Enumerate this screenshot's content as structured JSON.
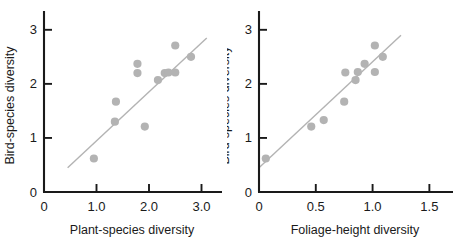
{
  "figure": {
    "background": "#ffffff",
    "point_color": "#b3b3b3",
    "line_color": "#b3b3b3",
    "axis_color": "#1a1a1a"
  },
  "chart_data": [
    {
      "type": "scatter",
      "panel": "left",
      "title": "",
      "xlabel": "Plant-species diversity",
      "ylabel": "Bird-species diversity",
      "xlim": [
        0,
        3.2
      ],
      "ylim": [
        0,
        3.2
      ],
      "xticks": [
        0,
        1.0,
        2.0,
        3.0
      ],
      "xticklabels": [
        "0",
        "1.0",
        "2.0",
        "3.0"
      ],
      "yticks": [
        0,
        1,
        2,
        3
      ],
      "yticklabels": [
        "0",
        "1",
        "2",
        "3"
      ],
      "grid": false,
      "legend": "none",
      "points": [
        {
          "x": 0.95,
          "y": 0.62
        },
        {
          "x": 1.35,
          "y": 1.3
        },
        {
          "x": 1.37,
          "y": 1.67
        },
        {
          "x": 1.78,
          "y": 2.2
        },
        {
          "x": 1.78,
          "y": 2.37
        },
        {
          "x": 1.92,
          "y": 1.21
        },
        {
          "x": 2.17,
          "y": 2.07
        },
        {
          "x": 2.3,
          "y": 2.2
        },
        {
          "x": 2.37,
          "y": 2.21
        },
        {
          "x": 2.5,
          "y": 2.21
        },
        {
          "x": 2.5,
          "y": 2.71
        },
        {
          "x": 2.8,
          "y": 2.5
        }
      ],
      "trendline": {
        "x0": 0.45,
        "y0": 0.45,
        "x1": 3.1,
        "y1": 2.85
      }
    },
    {
      "type": "scatter",
      "panel": "right",
      "title": "",
      "xlabel": "Foliage-height diversity",
      "ylabel": "Bird-species diversity",
      "xlim": [
        0,
        1.62
      ],
      "ylim": [
        0,
        3.2
      ],
      "xticks": [
        0,
        0.5,
        1.0,
        1.5
      ],
      "xticklabels": [
        "0",
        "0.5",
        "1.0",
        "1.5"
      ],
      "yticks": [
        0,
        1,
        2,
        3
      ],
      "yticklabels": [
        "0",
        "1",
        "2",
        "3"
      ],
      "grid": false,
      "legend": "none",
      "points": [
        {
          "x": 0.06,
          "y": 0.62
        },
        {
          "x": 0.46,
          "y": 1.21
        },
        {
          "x": 0.57,
          "y": 1.33
        },
        {
          "x": 0.75,
          "y": 1.67
        },
        {
          "x": 0.76,
          "y": 2.21
        },
        {
          "x": 0.85,
          "y": 2.07
        },
        {
          "x": 0.87,
          "y": 2.22
        },
        {
          "x": 0.93,
          "y": 2.37
        },
        {
          "x": 1.02,
          "y": 2.22
        },
        {
          "x": 1.02,
          "y": 2.71
        },
        {
          "x": 1.09,
          "y": 2.5
        }
      ],
      "trendline": {
        "x0": 0.0,
        "y0": 0.45,
        "x1": 1.25,
        "y1": 2.9
      }
    }
  ]
}
